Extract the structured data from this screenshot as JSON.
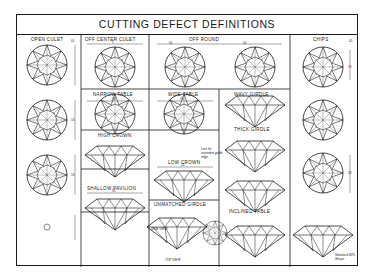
{
  "title": "CUTTING DEFECT DEFINITIONS",
  "sections": {
    "open_culet": {
      "label": "OPEN CULET",
      "dims": [
        "05",
        "16",
        "16",
        "16",
        "20"
      ]
    },
    "off_center_culet": {
      "label": "OFF CENTER CULET",
      "dim": "5"
    },
    "off_round": {
      "label": "OFF ROUND",
      "dims": [
        "05",
        "02"
      ]
    },
    "chips": {
      "label": "CHIPS",
      "dims": [
        "05",
        "19",
        "20"
      ]
    },
    "narrow_table": {
      "label": "NARROW TABLE",
      "dim": "56"
    },
    "wide_table": {
      "label": "WIDE TABLE",
      "dim": "70"
    },
    "wavy_girdle": {
      "label": "WAVY GIRDLE"
    },
    "thick_girdle": {
      "label": "THICK GIRDLE"
    },
    "high_crown": {
      "label": "HIGH CROWN"
    },
    "low_crown": {
      "label": "LOW CROWN",
      "dim": "10"
    },
    "shallow_pavilion": {
      "label": "SHALLOW PAVILION",
      "dim": "35"
    },
    "unmatched_girdle": {
      "label": "UNMATCHED GIRDLE"
    },
    "inclined_table": {
      "label": "INCLINED TABLE"
    },
    "side_view": {
      "label": "SIDE VIEW"
    },
    "top_view": {
      "label": "TOP VIEW"
    }
  },
  "notes": {
    "extended_girdle": "Line for extended girdle edge",
    "standard": "Standard 90% Shape"
  }
}
